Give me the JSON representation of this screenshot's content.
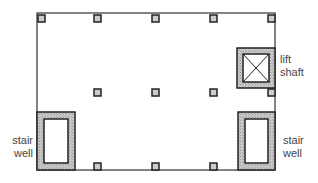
{
  "diagram": {
    "outline": {
      "x": 37,
      "y": 13,
      "w": 238,
      "h": 157
    },
    "columns": [
      {
        "x": 41,
        "y": 18
      },
      {
        "x": 97,
        "y": 18
      },
      {
        "x": 155,
        "y": 18
      },
      {
        "x": 213,
        "y": 18
      },
      {
        "x": 271,
        "y": 18
      },
      {
        "x": 97,
        "y": 92
      },
      {
        "x": 155,
        "y": 92
      },
      {
        "x": 213,
        "y": 92
      },
      {
        "x": 271,
        "y": 92
      },
      {
        "x": 97,
        "y": 166
      },
      {
        "x": 155,
        "y": 166
      },
      {
        "x": 213,
        "y": 166
      }
    ],
    "lift_shaft": {
      "x": 237,
      "y": 48,
      "w": 38,
      "h": 40,
      "label_line1": "lift",
      "label_line2": "shaft"
    },
    "stair_left": {
      "x": 37,
      "y": 112,
      "w": 38,
      "h": 58,
      "label_line1": "stair",
      "label_line2": "well"
    },
    "stair_right": {
      "x": 238,
      "y": 112,
      "w": 37,
      "h": 58,
      "label_line1": "stair",
      "label_line2": "well"
    }
  },
  "colors": {
    "line": "#333333",
    "hatch": "#bbbbbb",
    "column_fill": "#cccccc"
  }
}
